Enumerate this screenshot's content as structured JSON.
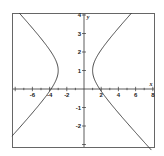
{
  "chart_data": {
    "type": "line",
    "title": "",
    "xlabel": "x",
    "ylabel": "y",
    "xlim": [
      -8.4,
      8.2
    ],
    "ylim": [
      -3.2,
      4.1
    ],
    "xticks": [
      -6,
      -4,
      -2,
      2,
      4,
      6,
      8
    ],
    "yticks": [
      -2,
      -1,
      1,
      2,
      3,
      4
    ],
    "grid": false,
    "legend": null,
    "equation": {
      "h": -1,
      "k": 1,
      "a": 2,
      "b": 1
    },
    "series": [
      {
        "name": "right-branch",
        "points": [
          [
            5.32,
            4
          ],
          [
            3.47,
            3
          ],
          [
            1.83,
            2
          ],
          [
            1,
            1
          ],
          [
            1.83,
            0
          ],
          [
            3.47,
            -1
          ],
          [
            5.32,
            -2
          ],
          [
            7.25,
            -3
          ]
        ]
      },
      {
        "name": "left-branch",
        "points": [
          [
            -7.32,
            4
          ],
          [
            -5.47,
            3
          ],
          [
            -3.83,
            2
          ],
          [
            -3,
            1
          ],
          [
            -3.83,
            0
          ],
          [
            -5.47,
            -1
          ],
          [
            -7.32,
            -2
          ],
          [
            -8.4,
            -2.56
          ]
        ]
      }
    ],
    "colors": {
      "curve": "#333333",
      "axis": "#333333",
      "frame": "#666666"
    }
  }
}
